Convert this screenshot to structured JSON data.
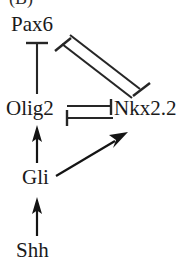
{
  "figure": {
    "panel_label": "(B)",
    "width": 191,
    "height": 270,
    "background_color": "#ffffff",
    "stroke_color": "#262626",
    "text_color": "#1a1a1a"
  },
  "nodes": [
    {
      "id": "pax6",
      "label": "Pax6",
      "x": 11,
      "y": 14
    },
    {
      "id": "olig2",
      "label": "Olig2",
      "x": 6,
      "y": 98
    },
    {
      "id": "nkx22",
      "label": "Nkx2.2",
      "x": 114,
      "y": 98
    },
    {
      "id": "gli",
      "label": "Gli",
      "x": 22,
      "y": 167
    },
    {
      "id": "shh",
      "label": "Shh",
      "x": 16,
      "y": 240
    }
  ],
  "edges": [
    {
      "id": "olig2-inhibits-pax6",
      "source": "olig2",
      "target": "pax6",
      "kind": "inhibition",
      "marker": "t-bar",
      "orientation": "vertical",
      "description": "Olig2 represses Pax6"
    },
    {
      "id": "pax6-inhibits-nkx22",
      "source": "pax6",
      "target": "nkx22",
      "kind": "inhibition",
      "marker": "t-bar",
      "orientation": "diagonal",
      "description": "Pax6 represses Nkx2.2"
    },
    {
      "id": "nkx22-inhibits-pax6",
      "source": "nkx22",
      "target": "pax6",
      "kind": "inhibition",
      "marker": "t-bar",
      "orientation": "diagonal",
      "description": "Nkx2.2 represses Pax6"
    },
    {
      "id": "olig2-inhibits-nkx22",
      "source": "olig2",
      "target": "nkx22",
      "kind": "inhibition",
      "marker": "t-bar",
      "orientation": "horizontal",
      "description": "Olig2 represses Nkx2.2"
    },
    {
      "id": "nkx22-inhibits-olig2",
      "source": "nkx22",
      "target": "olig2",
      "kind": "inhibition",
      "marker": "t-bar",
      "orientation": "horizontal",
      "description": "Nkx2.2 represses Olig2"
    },
    {
      "id": "gli-activates-olig2",
      "source": "gli",
      "target": "olig2",
      "kind": "activation",
      "marker": "arrowhead",
      "orientation": "vertical",
      "description": "Gli activates Olig2"
    },
    {
      "id": "gli-activates-nkx22",
      "source": "gli",
      "target": "nkx22",
      "kind": "activation",
      "marker": "arrowhead",
      "orientation": "diagonal",
      "description": "Gli activates Nkx2.2"
    },
    {
      "id": "shh-activates-gli",
      "source": "shh",
      "target": "gli",
      "kind": "activation",
      "marker": "arrowhead",
      "orientation": "vertical",
      "description": "Shh activates Gli"
    }
  ],
  "legend": {
    "activation_symbol": "arrow",
    "inhibition_symbol": "bar"
  }
}
